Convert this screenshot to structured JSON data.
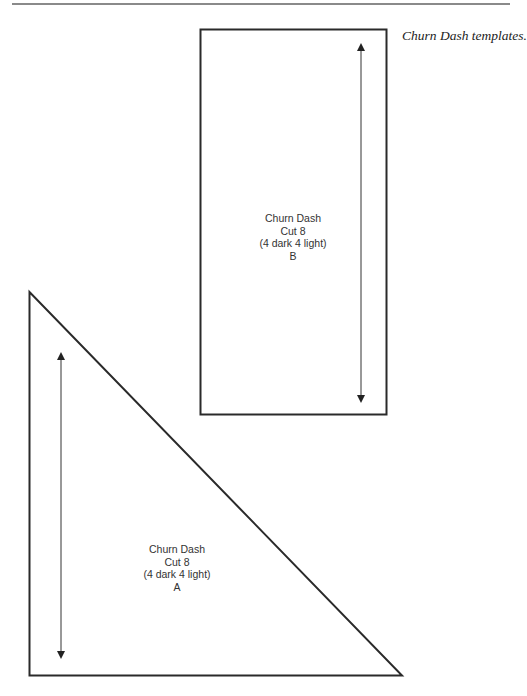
{
  "page": {
    "caption": "Churn Dash templates."
  },
  "templates": [
    {
      "id": "B",
      "shape": "rectangle",
      "lines": [
        "Churn Dash",
        "Cut 8",
        "(4 dark 4 light)",
        "B"
      ]
    },
    {
      "id": "A",
      "shape": "right-triangle",
      "lines": [
        "Churn Dash",
        "Cut 8",
        "(4 dark 4 light)",
        "A"
      ]
    }
  ],
  "colors": {
    "outline": "#2a2a2a",
    "rule": "#8a8a8a",
    "text": "#333333"
  }
}
